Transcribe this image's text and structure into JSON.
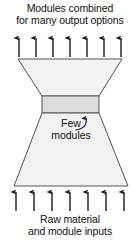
{
  "diagram": {
    "title_top_line1": "Modules combined",
    "title_top_line2": "for many output options",
    "title_bottom_line1": "Raw material",
    "title_bottom_line2": "and module inputs",
    "callout_line1": "Few",
    "callout_line2": "modules",
    "colors": {
      "stroke": "#555555",
      "upper_fill": "#f4f4f4",
      "lower_fill": "#f2f2f2",
      "waist_fill": "#dcdcdc",
      "arrow": "#1a1a1a",
      "background": "#ffffff",
      "text": "#111111"
    },
    "shapes": {
      "upper_trapezoid": {
        "name": "modules-combined-output-funnel",
        "top_left_x": 18,
        "top_right_x": 122,
        "top_y": 59,
        "bottom_left_x": 42,
        "bottom_right_x": 99,
        "bottom_y": 96
      },
      "waist_band": {
        "name": "few-modules-band",
        "left_x": 42,
        "right_x": 99,
        "top_y": 96,
        "bottom_y": 113
      },
      "lower_trapezoid": {
        "name": "raw-material-input-funnel",
        "top_left_x": 42,
        "top_right_x": 99,
        "top_y": 113,
        "bottom_left_x": 14,
        "bottom_right_x": 128,
        "bottom_y": 186
      }
    },
    "arrows": {
      "top": {
        "name": "output-arrows",
        "count": 7,
        "direction": "up",
        "y_tail": 57,
        "y_head": 36,
        "xs": [
          19,
          36,
          53,
          70,
          87,
          104,
          121
        ]
      },
      "bottom": {
        "name": "input-arrows",
        "count": 7,
        "direction": "up",
        "y_tail": 211,
        "y_head": 190,
        "xs": [
          16,
          34,
          52,
          70,
          88,
          106,
          124
        ]
      },
      "callout": {
        "name": "few-modules-leader-arrow",
        "head_x": 86,
        "head_y": 112,
        "curve": "M 76 131 C 83 130 87 126 86 116"
      }
    }
  }
}
